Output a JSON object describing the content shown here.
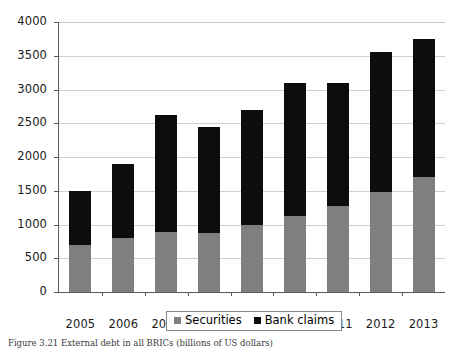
{
  "chart_data": {
    "type": "bar",
    "subtype": "stacked-vertical",
    "title": "",
    "xlabel": "",
    "ylabel": "",
    "categories": [
      "2005",
      "2006",
      "2007",
      "2008",
      "2009",
      "2010",
      "2011",
      "2012",
      "2013"
    ],
    "series": [
      {
        "name": "Securities",
        "color": "#7f7f7f",
        "values": [
          690,
          800,
          890,
          880,
          1000,
          1130,
          1270,
          1480,
          1700
        ]
      },
      {
        "name": "Bank claims",
        "color": "#0d0d0d",
        "values": [
          810,
          1090,
          1730,
          1570,
          1690,
          1960,
          1820,
          2080,
          2050
        ]
      }
    ],
    "totals": [
      1500,
      1890,
      2620,
      2450,
      2690,
      3090,
      3290,
      3560,
      3750
    ],
    "ylim": [
      0,
      4000
    ],
    "yticks": [
      0,
      500,
      1000,
      1500,
      2000,
      2500,
      3000,
      3500,
      4000
    ],
    "ytick_labels": [
      "0",
      "500",
      "1000",
      "1500",
      "2000",
      "2500",
      "3000",
      "3500",
      "4000"
    ],
    "grid": true,
    "grid_axis": "y",
    "legend_position": "bottom-center",
    "legend_entries": [
      "Securities",
      "Bank claims"
    ]
  },
  "legend": {
    "securities_label": "Securities",
    "bank_claims_label": "Bank claims"
  },
  "caption": {
    "text": "Figure 3.21  External debt in all BRICs (billions of US dollars)"
  }
}
